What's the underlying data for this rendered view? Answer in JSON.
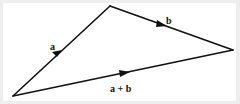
{
  "diagram": {
    "vertices": {
      "origin": [
        13,
        96
      ],
      "apex": [
        110,
        6
      ],
      "end": [
        233,
        50
      ]
    },
    "vectors": [
      {
        "name": "a",
        "label": "a",
        "from": "origin",
        "to": "apex",
        "label_pos": [
          51,
          49
        ]
      },
      {
        "name": "b",
        "label": "b",
        "from": "apex",
        "to": "end",
        "label_pos": [
          166,
          23
        ]
      },
      {
        "name": "a-plus-b",
        "label": "a + b",
        "from": "origin",
        "to": "end",
        "label_pos": [
          110,
          91
        ]
      }
    ],
    "colors": {
      "line": "#111111",
      "background": "#ffffff",
      "border": "#eeeeee"
    }
  }
}
